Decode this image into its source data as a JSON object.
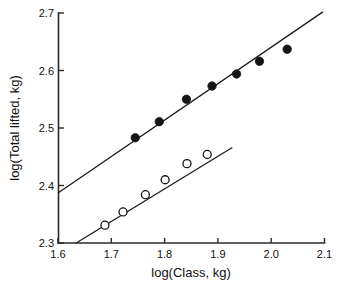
{
  "chart_data": {
    "type": "scatter",
    "title": "",
    "xlabel": "log(Class, kg)",
    "ylabel": "log(Total lifted, kg)",
    "xlim": [
      1.6,
      2.1
    ],
    "ylim": [
      2.3,
      2.7
    ],
    "xticks": [
      "1.6",
      "1.7",
      "1.8",
      "1.9",
      "2.0",
      "2.1"
    ],
    "yticks": [
      "2.3",
      "2.4",
      "2.5",
      "2.6",
      "2.7"
    ],
    "xtick_values": [
      1.6,
      1.7,
      1.8,
      1.9,
      2.0,
      2.1
    ],
    "ytick_values": [
      2.3,
      2.4,
      2.5,
      2.6,
      2.7
    ],
    "grid": false,
    "legend": "none",
    "series": [
      {
        "name": "filled-circles",
        "marker": "filled-circle",
        "color": "#151515",
        "x": [
          1.745,
          1.79,
          1.841,
          1.889,
          1.935,
          1.978,
          2.03
        ],
        "y": [
          2.483,
          2.511,
          2.55,
          2.573,
          2.594,
          2.616,
          2.637
        ],
        "fit_line": {
          "x0": 1.6,
          "y0": 2.387,
          "x1": 2.097,
          "y1": 2.702
        }
      },
      {
        "name": "open-circles",
        "marker": "open-circle",
        "color": "#151515",
        "x": [
          1.688,
          1.722,
          1.764,
          1.801,
          1.842,
          1.88
        ],
        "y": [
          2.331,
          2.354,
          2.384,
          2.41,
          2.438,
          2.454
        ],
        "fit_line": {
          "x0": 1.634,
          "y0": 2.3,
          "x1": 1.927,
          "y1": 2.466
        }
      }
    ]
  },
  "labels": {
    "x_axis_title": "log(Class, kg)",
    "y_axis_title": "log(Total lifted, kg)"
  }
}
